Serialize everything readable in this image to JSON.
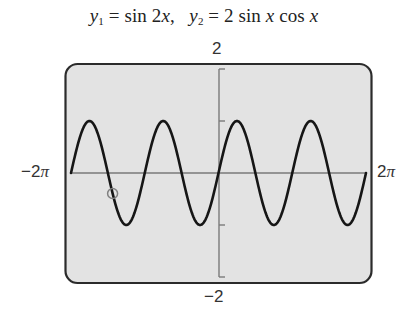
{
  "chart_data": {
    "type": "line",
    "title": "y1 = sin 2x,  y2 = 2 sin x cos x",
    "title_parts": {
      "y1_var": "y",
      "y1_sub": "1",
      "eq1": " = sin 2",
      "x1": "x",
      "sep": ",   ",
      "y2_var": "y",
      "y2_sub": "2",
      "eq2": " = 2 sin ",
      "x2": "x",
      "cos": " cos ",
      "x3": "x"
    },
    "series": [
      {
        "name": "y1 = sin 2x",
        "expression": "sin(2x)",
        "color": "#1a1a1a"
      },
      {
        "name": "y2 = 2 sin x cos x",
        "expression": "2*sin(x)*cos(x)",
        "color": "#1a1a1a",
        "note": "identical to y1, overlapping"
      }
    ],
    "x": [
      "-2π",
      "-7π/4",
      "-3π/2",
      "-5π/4",
      "-π",
      "-3π/4",
      "-π/2",
      "-π/4",
      "0",
      "π/4",
      "π/2",
      "3π/4",
      "π",
      "5π/4",
      "3π/2",
      "7π/4",
      "2π"
    ],
    "values": [
      0,
      1,
      0,
      -1,
      0,
      1,
      0,
      -1,
      0,
      1,
      0,
      -1,
      0,
      1,
      0,
      -1,
      0
    ],
    "xlim": [
      "-2π",
      "2π"
    ],
    "ylim": [
      -2,
      2
    ],
    "xlabel": "",
    "ylabel": "",
    "x_tick_labels": {
      "left": "−2",
      "left_pi": "π",
      "right": "2",
      "right_pi": "π"
    },
    "y_tick_labels": {
      "top": "2",
      "bottom": "−2"
    },
    "y_ticks": [
      -2,
      -1,
      1,
      2
    ],
    "grid": false,
    "legend": "none",
    "trace_cursor": {
      "x_approx": -4.51,
      "y_approx": -0.4,
      "shape": "circle"
    },
    "colors": {
      "screen_background": "#e3e3e3",
      "frame": "#2b2b2b",
      "axes": "#7a7a7a",
      "curve": "#161616",
      "cursor": "#808080"
    }
  }
}
